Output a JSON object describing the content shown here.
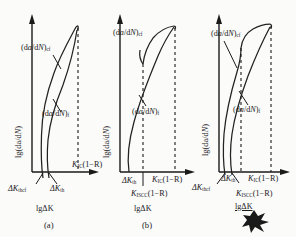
{
  "figure": {
    "type": "three-panel-schematic",
    "axis": {
      "y_label": "lg(da/dN)",
      "x_label": "lgΔK"
    },
    "ink_blotch": "dark-ink-blotch-artifact"
  },
  "panels": [
    {
      "id": "a",
      "caption": "(a)",
      "y_label": "lg(da/d",
      "y_label_italic_N": "N",
      "y_label_tail": ")",
      "curves": [
        {
          "name": "corrosion-fatigue-curve",
          "label_prefix": "(d",
          "label_a": "a",
          "label_mid": "/d",
          "label_N": "N",
          "label_suffix": ")",
          "subscript": "cf"
        },
        {
          "name": "fatigue-curve",
          "label_prefix": "(d",
          "label_a": "a",
          "label_mid": "/d",
          "label_N": "N",
          "label_suffix": ")",
          "subscript": "f"
        }
      ],
      "x_ticks": [
        {
          "name": "delta-k-thcf",
          "sym": "ΔK",
          "sub": "thcf"
        },
        {
          "name": "delta-k-th",
          "sym": "ΔK",
          "sub": "th"
        }
      ],
      "dashed_lines": [
        {
          "name": "kic-line",
          "sym": "K",
          "sub": "IC",
          "suffix": "(1−R)"
        }
      ],
      "x_axis_label": "lgΔK"
    },
    {
      "id": "b",
      "caption": "(b)",
      "y_label": "lg(da/d",
      "y_label_italic_N": "N",
      "y_label_tail": ")",
      "curves": [
        {
          "name": "corrosion-fatigue-curve",
          "label_prefix": "(d",
          "label_a": "a",
          "label_mid": "/d",
          "label_N": "N",
          "label_suffix": ")",
          "subscript": "cf"
        },
        {
          "name": "fatigue-curve",
          "label_prefix": "(d",
          "label_a": "a",
          "label_mid": "/d",
          "label_N": "N",
          "label_suffix": ")",
          "subscript": "f"
        }
      ],
      "x_ticks": [
        {
          "name": "delta-k-th",
          "sym": "ΔK",
          "sub": "th"
        }
      ],
      "dashed_lines": [
        {
          "name": "kiscc-line",
          "sym": "K",
          "sub": "ISCC",
          "suffix": "(1−R)"
        },
        {
          "name": "kic-line",
          "sym": "K",
          "sub": "IC",
          "suffix": "(1−R)"
        }
      ],
      "x_axis_label": "lgΔK"
    },
    {
      "id": "c",
      "caption": "",
      "y_label": "lg(da/d",
      "y_label_italic_N": "N",
      "y_label_tail": ")",
      "curves": [
        {
          "name": "corrosion-fatigue-curve",
          "label_prefix": "(d",
          "label_a": "a",
          "label_mid": "/d",
          "label_N": "N",
          "label_suffix": ")",
          "subscript": "cf"
        },
        {
          "name": "fatigue-curve",
          "label_prefix": "(d",
          "label_a": "a",
          "label_mid": "/d",
          "label_N": "N",
          "label_suffix": ")",
          "subscript": "f"
        }
      ],
      "x_ticks": [
        {
          "name": "delta-k-thcf",
          "sym": "ΔK",
          "sub": "thcf"
        },
        {
          "name": "delta-k-th",
          "sym": "ΔK",
          "sub": "th"
        }
      ],
      "dashed_lines": [
        {
          "name": "kiscc-line",
          "sym": "K",
          "sub": "ISCC",
          "suffix": "(1−R)"
        },
        {
          "name": "kic-line",
          "sym": "K",
          "sub": "IC",
          "suffix": "(1−R)"
        }
      ],
      "x_axis_label": "lgΔK"
    }
  ],
  "colors": {
    "ink": "#1a1a1a",
    "paper": "#fbfbfa",
    "curve": "#222222"
  }
}
